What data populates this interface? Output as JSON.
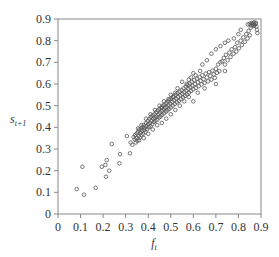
{
  "chart_data": {
    "type": "scatter",
    "title": "",
    "xlabel": "f_t",
    "xlabel_main": "f",
    "xlabel_sub": "t",
    "ylabel": "s_{t+1}",
    "ylabel_main": "s",
    "ylabel_sub": "t+1",
    "xlim": [
      0,
      0.9
    ],
    "ylim": [
      0,
      0.9
    ],
    "xticks": [
      "0",
      "0.1",
      "0.2",
      "0.3",
      "0.4",
      "0.5",
      "0.6",
      "0.7",
      "0.8",
      "0.9"
    ],
    "yticks": [
      "0",
      "0.1",
      "0.2",
      "0.3",
      "0.4",
      "0.5",
      "0.6",
      "0.7",
      "0.8",
      "0.9"
    ],
    "grid": false,
    "legend": null,
    "marker": "hollow-circle",
    "marker_color": "#555555",
    "series": [
      {
        "name": "observations",
        "points": [
          [
            0.083,
            0.115
          ],
          [
            0.115,
            0.089
          ],
          [
            0.167,
            0.121
          ],
          [
            0.108,
            0.218
          ],
          [
            0.194,
            0.218
          ],
          [
            0.21,
            0.226
          ],
          [
            0.227,
            0.2
          ],
          [
            0.213,
            0.172
          ],
          [
            0.216,
            0.249
          ],
          [
            0.238,
            0.323
          ],
          [
            0.275,
            0.276
          ],
          [
            0.272,
            0.234
          ],
          [
            0.305,
            0.36
          ],
          [
            0.319,
            0.28
          ],
          [
            0.322,
            0.33
          ],
          [
            0.33,
            0.32
          ],
          [
            0.335,
            0.355
          ],
          [
            0.34,
            0.345
          ],
          [
            0.342,
            0.365
          ],
          [
            0.348,
            0.35
          ],
          [
            0.35,
            0.372
          ],
          [
            0.352,
            0.338
          ],
          [
            0.355,
            0.38
          ],
          [
            0.358,
            0.36
          ],
          [
            0.36,
            0.39
          ],
          [
            0.362,
            0.352
          ],
          [
            0.365,
            0.375
          ],
          [
            0.368,
            0.395
          ],
          [
            0.37,
            0.365
          ],
          [
            0.372,
            0.385
          ],
          [
            0.375,
            0.4
          ],
          [
            0.378,
            0.37
          ],
          [
            0.38,
            0.41
          ],
          [
            0.382,
            0.388
          ],
          [
            0.385,
            0.398
          ],
          [
            0.388,
            0.378
          ],
          [
            0.39,
            0.42
          ],
          [
            0.392,
            0.405
          ],
          [
            0.395,
            0.392
          ],
          [
            0.398,
            0.43
          ],
          [
            0.4,
            0.415
          ],
          [
            0.402,
            0.4
          ],
          [
            0.405,
            0.44
          ],
          [
            0.408,
            0.42
          ],
          [
            0.41,
            0.405
          ],
          [
            0.412,
            0.448
          ],
          [
            0.415,
            0.43
          ],
          [
            0.418,
            0.415
          ],
          [
            0.42,
            0.455
          ],
          [
            0.422,
            0.44
          ],
          [
            0.425,
            0.425
          ],
          [
            0.428,
            0.46
          ],
          [
            0.43,
            0.445
          ],
          [
            0.432,
            0.43
          ],
          [
            0.435,
            0.47
          ],
          [
            0.438,
            0.45
          ],
          [
            0.44,
            0.435
          ],
          [
            0.442,
            0.478
          ],
          [
            0.445,
            0.46
          ],
          [
            0.448,
            0.445
          ],
          [
            0.45,
            0.485
          ],
          [
            0.452,
            0.468
          ],
          [
            0.455,
            0.45
          ],
          [
            0.458,
            0.492
          ],
          [
            0.46,
            0.475
          ],
          [
            0.462,
            0.458
          ],
          [
            0.465,
            0.5
          ],
          [
            0.468,
            0.482
          ],
          [
            0.47,
            0.465
          ],
          [
            0.472,
            0.505
          ],
          [
            0.475,
            0.49
          ],
          [
            0.478,
            0.472
          ],
          [
            0.48,
            0.512
          ],
          [
            0.482,
            0.495
          ],
          [
            0.485,
            0.478
          ],
          [
            0.488,
            0.52
          ],
          [
            0.49,
            0.502
          ],
          [
            0.492,
            0.485
          ],
          [
            0.495,
            0.528
          ],
          [
            0.498,
            0.51
          ],
          [
            0.5,
            0.492
          ],
          [
            0.503,
            0.535
          ],
          [
            0.506,
            0.518
          ],
          [
            0.509,
            0.5
          ],
          [
            0.512,
            0.542
          ],
          [
            0.515,
            0.525
          ],
          [
            0.518,
            0.508
          ],
          [
            0.521,
            0.55
          ],
          [
            0.524,
            0.532
          ],
          [
            0.527,
            0.515
          ],
          [
            0.53,
            0.558
          ],
          [
            0.533,
            0.54
          ],
          [
            0.536,
            0.522
          ],
          [
            0.539,
            0.565
          ],
          [
            0.542,
            0.548
          ],
          [
            0.545,
            0.53
          ],
          [
            0.548,
            0.572
          ],
          [
            0.551,
            0.555
          ],
          [
            0.554,
            0.538
          ],
          [
            0.557,
            0.58
          ],
          [
            0.56,
            0.562
          ],
          [
            0.563,
            0.545
          ],
          [
            0.566,
            0.588
          ],
          [
            0.569,
            0.57
          ],
          [
            0.572,
            0.552
          ],
          [
            0.575,
            0.595
          ],
          [
            0.578,
            0.578
          ],
          [
            0.581,
            0.56
          ],
          [
            0.584,
            0.602
          ],
          [
            0.587,
            0.585
          ],
          [
            0.59,
            0.568
          ],
          [
            0.593,
            0.61
          ],
          [
            0.596,
            0.592
          ],
          [
            0.6,
            0.575
          ],
          [
            0.604,
            0.618
          ],
          [
            0.608,
            0.6
          ],
          [
            0.612,
            0.582
          ],
          [
            0.616,
            0.625
          ],
          [
            0.62,
            0.608
          ],
          [
            0.624,
            0.59
          ],
          [
            0.628,
            0.632
          ],
          [
            0.632,
            0.615
          ],
          [
            0.636,
            0.598
          ],
          [
            0.64,
            0.64
          ],
          [
            0.645,
            0.622
          ],
          [
            0.65,
            0.605
          ],
          [
            0.655,
            0.648
          ],
          [
            0.66,
            0.63
          ],
          [
            0.665,
            0.612
          ],
          [
            0.67,
            0.655
          ],
          [
            0.675,
            0.638
          ],
          [
            0.68,
            0.62
          ],
          [
            0.685,
            0.662
          ],
          [
            0.69,
            0.645
          ],
          [
            0.695,
            0.628
          ],
          [
            0.7,
            0.67
          ],
          [
            0.705,
            0.652
          ],
          [
            0.71,
            0.69
          ],
          [
            0.715,
            0.66
          ],
          [
            0.72,
            0.7
          ],
          [
            0.728,
            0.705
          ],
          [
            0.735,
            0.72
          ],
          [
            0.74,
            0.69
          ],
          [
            0.745,
            0.735
          ],
          [
            0.752,
            0.71
          ],
          [
            0.76,
            0.745
          ],
          [
            0.765,
            0.725
          ],
          [
            0.77,
            0.76
          ],
          [
            0.778,
            0.74
          ],
          [
            0.785,
            0.77
          ],
          [
            0.79,
            0.75
          ],
          [
            0.795,
            0.79
          ],
          [
            0.802,
            0.765
          ],
          [
            0.81,
            0.8
          ],
          [
            0.815,
            0.78
          ],
          [
            0.822,
            0.815
          ],
          [
            0.828,
            0.795
          ],
          [
            0.835,
            0.83
          ],
          [
            0.84,
            0.81
          ],
          [
            0.845,
            0.845
          ],
          [
            0.85,
            0.825
          ],
          [
            0.855,
            0.86
          ],
          [
            0.858,
            0.87
          ],
          [
            0.862,
            0.875
          ],
          [
            0.865,
            0.88
          ],
          [
            0.868,
            0.868
          ],
          [
            0.87,
            0.885
          ],
          [
            0.872,
            0.872
          ],
          [
            0.875,
            0.878
          ],
          [
            0.878,
            0.882
          ],
          [
            0.88,
            0.865
          ],
          [
            0.882,
            0.85
          ],
          [
            0.884,
            0.835
          ],
          [
            0.842,
            0.875
          ],
          [
            0.85,
            0.878
          ],
          [
            0.858,
            0.882
          ],
          [
            0.6,
            0.65
          ],
          [
            0.64,
            0.69
          ],
          [
            0.66,
            0.71
          ],
          [
            0.7,
            0.76
          ],
          [
            0.72,
            0.775
          ],
          [
            0.74,
            0.79
          ],
          [
            0.755,
            0.8
          ],
          [
            0.78,
            0.81
          ],
          [
            0.8,
            0.83
          ],
          [
            0.81,
            0.85
          ],
          [
            0.68,
            0.74
          ],
          [
            0.62,
            0.56
          ],
          [
            0.7,
            0.6
          ],
          [
            0.74,
            0.66
          ],
          [
            0.56,
            0.52
          ],
          [
            0.52,
            0.48
          ],
          [
            0.48,
            0.44
          ],
          [
            0.46,
            0.42
          ],
          [
            0.44,
            0.41
          ],
          [
            0.42,
            0.39
          ],
          [
            0.38,
            0.35
          ],
          [
            0.36,
            0.34
          ],
          [
            0.345,
            0.33
          ],
          [
            0.4,
            0.37
          ],
          [
            0.5,
            0.46
          ],
          [
            0.54,
            0.5
          ],
          [
            0.58,
            0.54
          ],
          [
            0.53,
            0.58
          ],
          [
            0.55,
            0.61
          ],
          [
            0.5,
            0.55
          ],
          [
            0.47,
            0.52
          ],
          [
            0.45,
            0.5
          ],
          [
            0.43,
            0.48
          ],
          [
            0.41,
            0.46
          ],
          [
            0.39,
            0.44
          ],
          [
            0.37,
            0.41
          ],
          [
            0.355,
            0.395
          ],
          [
            0.6,
            0.52
          ],
          [
            0.65,
            0.58
          ],
          [
            0.63,
            0.66
          ],
          [
            0.58,
            0.62
          ],
          [
            0.57,
            0.6
          ],
          [
            0.59,
            0.63
          ],
          [
            0.61,
            0.64
          ],
          [
            0.52,
            0.56
          ],
          [
            0.51,
            0.54
          ],
          [
            0.49,
            0.53
          ],
          [
            0.46,
            0.49
          ]
        ]
      }
    ]
  }
}
